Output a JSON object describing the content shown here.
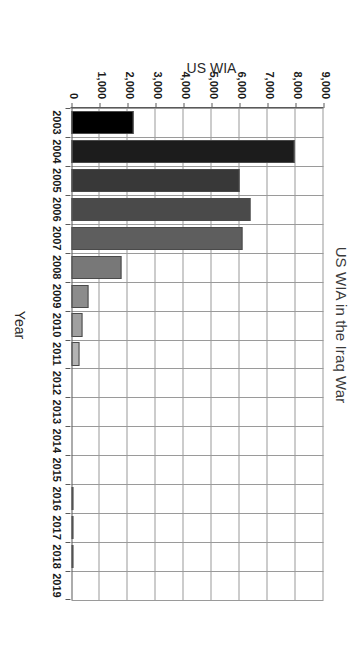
{
  "chart_data": {
    "type": "bar",
    "title": "US WIA in the Iraq War",
    "xlabel": "Year",
    "ylabel": "US WIA",
    "orientation": "vertical-rotated-90cw",
    "grid": true,
    "legend": "none",
    "ylim": [
      0,
      9000
    ],
    "ytick_interval": 1000,
    "ytick_labels": [
      "9,000",
      "8,000",
      "7,000",
      "6,000",
      "5,000",
      "4,000",
      "3,000",
      "2,000",
      "1,000",
      "0"
    ],
    "ytick_values": [
      9000,
      8000,
      7000,
      6000,
      5000,
      4000,
      3000,
      2000,
      1000,
      0
    ],
    "categories": [
      "2003",
      "2004",
      "2005",
      "2006",
      "2007",
      "2008",
      "2009",
      "2010",
      "2011",
      "2012",
      "2013",
      "2014",
      "2015",
      "2016",
      "2017",
      "2018",
      "2019"
    ],
    "values": [
      2200,
      7950,
      6000,
      6400,
      6100,
      1800,
      600,
      400,
      300,
      0,
      0,
      0,
      0,
      40,
      45,
      50,
      0
    ],
    "bar_colors": [
      "#000000",
      "#1c1c1c",
      "#383838",
      "#4a4a4a",
      "#5e5e5e",
      "#787878",
      "#8c8c8c",
      "#a0a0a0",
      "#b4b4b4",
      "#c0c0c0",
      "#c4c4c4",
      "#c8c8c8",
      "#cccccc",
      "#d0d0d0",
      "#d4d4d4",
      "#d8d8d8",
      "#dcdcdc"
    ],
    "axis_color": "#5a5a5a",
    "grid_color": "#9a9a9a",
    "background": "#ffffff"
  }
}
